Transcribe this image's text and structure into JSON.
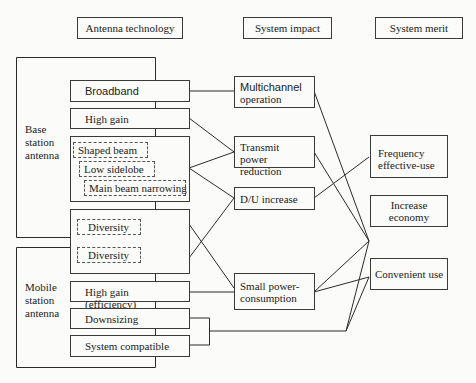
{
  "headers": {
    "technology": "Antenna technology",
    "impact": "System impact",
    "merit": "System merit"
  },
  "groups": {
    "base": [
      "Base",
      "station",
      "antenna"
    ],
    "mobile": [
      "Mobile",
      "station",
      "antenna"
    ]
  },
  "technology": {
    "broadband": "Broadband",
    "high_gain": "High gain",
    "shaped_beam": "Shaped beam",
    "low_sidelobe": "Low sidelobe",
    "main_beam_narrowing": "Main beam narrowing",
    "diversity_1": "Diversity",
    "diversity_2": "Diversity",
    "high_gain_efficiency": "High gain (efficiency)",
    "downsizing": "Downsizing",
    "system_compatible": "System compatible"
  },
  "impact": {
    "multichannel": [
      "Multichannel",
      "operation"
    ],
    "transmit_power": [
      "Transmit power",
      "reduction"
    ],
    "du_increase": "D/U increase",
    "small_power": [
      "Small power-",
      "consumption"
    ]
  },
  "merit": {
    "frequency": [
      "Frequency",
      "effective-use"
    ],
    "economy": [
      "Increase",
      "economy"
    ],
    "convenient": "Convenient use"
  },
  "connections": [
    [
      "Broadband",
      "Multichannel operation"
    ],
    [
      "High gain",
      "Transmit power reduction"
    ],
    [
      "Beam shaping group",
      "Transmit power reduction"
    ],
    [
      "Beam shaping group",
      "D/U increase"
    ],
    [
      "Diversity group",
      "D/U increase"
    ],
    [
      "Diversity group",
      "Small power-consumption"
    ],
    [
      "High gain (efficiency)",
      "Small power-consumption"
    ],
    [
      "Downsizing + System compatible",
      "Increase economy"
    ],
    [
      "Downsizing + System compatible",
      "Convenient use"
    ],
    [
      "Multichannel operation",
      "Increase economy"
    ],
    [
      "Transmit power reduction",
      "Increase economy"
    ],
    [
      "D/U increase",
      "Frequency effective-use"
    ],
    [
      "Small power-consumption",
      "Increase economy"
    ],
    [
      "Small power-consumption",
      "Convenient use"
    ]
  ]
}
